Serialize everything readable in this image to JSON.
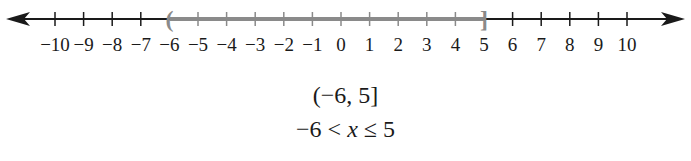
{
  "number_line": {
    "min": -10,
    "max": 10,
    "step": 1,
    "tick_labels": [
      "−10",
      "−9",
      "−8",
      "−7",
      "−6",
      "−5",
      "−4",
      "−3",
      "−2",
      "−1",
      "0",
      "1",
      "2",
      "3",
      "4",
      "5",
      "6",
      "7",
      "8",
      "9",
      "10"
    ],
    "axis_color": "#1a1a1a",
    "highlight": {
      "start": -6,
      "end": 5,
      "start_symbol": "(",
      "end_symbol": "]",
      "start_inclusive": false,
      "end_inclusive": true,
      "color": "#8a8a8a"
    },
    "arrows": [
      "left",
      "right"
    ]
  },
  "interval_notation": "(−6, 5]",
  "inequality": {
    "left": "−6 < ",
    "variable": "x",
    "right": " ≤ 5"
  }
}
